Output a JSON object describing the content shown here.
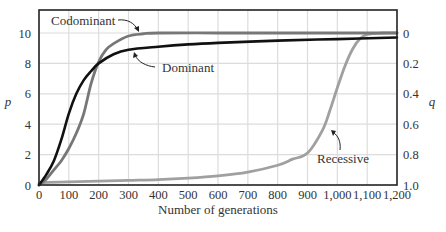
{
  "chart_data": {
    "type": "line",
    "title": "",
    "xlabel": "Number of generations",
    "ylabel": "p",
    "ylabel_right": "q",
    "xlim": [
      0,
      1200
    ],
    "ylim": [
      0,
      10
    ],
    "ylim_right": [
      1.0,
      0
    ],
    "grid": true,
    "x_ticks": [
      "0",
      "100",
      "200",
      "300",
      "400",
      "500",
      "600",
      "700",
      "800",
      "900",
      "1,000",
      "1,100",
      "1,200"
    ],
    "y_ticks": [
      "0",
      "2",
      "4",
      "6",
      "8",
      "10"
    ],
    "y_ticks_right": [
      "1.0",
      "0.8",
      "0.6",
      "0.4",
      "0.2",
      "0"
    ],
    "series": [
      {
        "name": "Dominant",
        "color": "#111111",
        "x": [
          0,
          25,
          50,
          75,
          100,
          125,
          150,
          175,
          200,
          250,
          300,
          400,
          500,
          600,
          800,
          1000,
          1200
        ],
        "values": [
          0,
          0.7,
          1.6,
          3.0,
          4.7,
          6.0,
          6.9,
          7.5,
          8.0,
          8.6,
          8.9,
          9.1,
          9.25,
          9.35,
          9.5,
          9.6,
          9.7
        ]
      },
      {
        "name": "Codominant",
        "color": "#777777",
        "x": [
          0,
          25,
          50,
          75,
          100,
          125,
          150,
          175,
          200,
          225,
          250,
          300,
          350,
          400,
          600,
          800,
          1000,
          1200
        ],
        "values": [
          0,
          0.4,
          1.0,
          1.6,
          2.4,
          3.4,
          4.7,
          6.7,
          8.1,
          8.9,
          9.3,
          9.8,
          9.95,
          10,
          10,
          10,
          10,
          10
        ]
      },
      {
        "name": "Recessive",
        "color": "#a0a0a0",
        "x": [
          0,
          10,
          100,
          200,
          300,
          400,
          500,
          600,
          700,
          800,
          850,
          900,
          950,
          975,
          1000,
          1025,
          1050,
          1075,
          1100,
          1150,
          1200
        ],
        "values": [
          0,
          0.15,
          0.2,
          0.25,
          0.3,
          0.35,
          0.45,
          0.6,
          0.85,
          1.3,
          1.7,
          2.1,
          3.6,
          4.9,
          6.4,
          7.8,
          8.9,
          9.6,
          9.9,
          10,
          10
        ]
      }
    ],
    "annotations": [
      {
        "text": "Codominant",
        "points_to": "Codominant"
      },
      {
        "text": "Dominant",
        "points_to": "Dominant"
      },
      {
        "text": "Recessive",
        "points_to": "Recessive"
      }
    ]
  },
  "labels": {
    "xlabel": "Number of generations",
    "ylabel_left": "p",
    "ylabel_right": "q",
    "codominant": "Codominant",
    "dominant": "Dominant",
    "recessive": "Recessive"
  }
}
